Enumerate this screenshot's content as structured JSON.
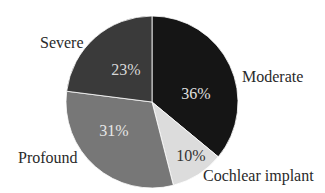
{
  "chart_data": {
    "type": "pie",
    "title": "",
    "categories": [
      "Moderate",
      "Cochlear implant",
      "Profound",
      "Severe"
    ],
    "values": [
      36,
      10,
      31,
      23
    ],
    "unit": "%",
    "colors": [
      "#151515",
      "#dcdcdc",
      "#777777",
      "#3a3a3a"
    ],
    "start_angle": "12 o'clock",
    "direction": "clockwise",
    "legend": "none (outside labels)",
    "labels": {
      "moderate": "Moderate",
      "cochlear": "Cochlear implant",
      "profound": "Profound",
      "severe": "Severe"
    },
    "pct_labels": {
      "moderate": "36%",
      "cochlear": "10%",
      "profound": "31%",
      "severe": "23%"
    }
  }
}
